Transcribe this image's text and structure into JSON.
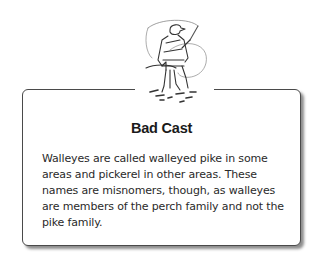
{
  "sidebar": {
    "illustration": "fisherman-casting-icon",
    "title": "Bad Cast",
    "body": "Walleyes are called walleyed pike in some areas and pickerel in other areas. These names are misnomers, though, as walleyes are members of the perch family and not the pike family."
  },
  "colors": {
    "border": "#4a4a4a",
    "text": "#2a2a2a",
    "background": "#ffffff"
  }
}
